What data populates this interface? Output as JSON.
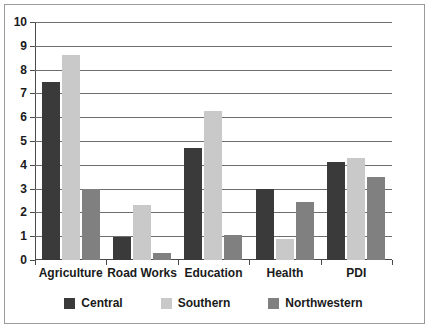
{
  "chart_data": {
    "type": "bar",
    "title": "",
    "subtitle": "",
    "xlabel": "",
    "ylabel": "",
    "ylim": [
      0,
      10
    ],
    "ytick_step": 1,
    "yticks": [
      "0",
      "1",
      "2",
      "3",
      "4",
      "5",
      "6",
      "7",
      "8",
      "9",
      "10"
    ],
    "grid": "horizontal",
    "legend_position": "bottom",
    "categories": [
      "Agriculture",
      "Road Works",
      "Education",
      "Health",
      "PDI"
    ],
    "series": [
      {
        "name": "Central",
        "color": "#3a3a3a",
        "values": [
          7.5,
          0.95,
          4.7,
          3.0,
          4.1
        ]
      },
      {
        "name": "Southern",
        "color": "#c9c9c9",
        "values": [
          8.6,
          2.3,
          6.25,
          0.9,
          4.3
        ]
      },
      {
        "name": "Northwestern",
        "color": "#808080",
        "values": [
          3.0,
          0.3,
          1.05,
          2.45,
          3.5
        ]
      }
    ]
  },
  "legend": {
    "items": [
      {
        "label": "Central",
        "swatch": "central"
      },
      {
        "label": "Southern",
        "swatch": "southern"
      },
      {
        "label": "Northwestern",
        "swatch": "northwestern"
      }
    ]
  }
}
